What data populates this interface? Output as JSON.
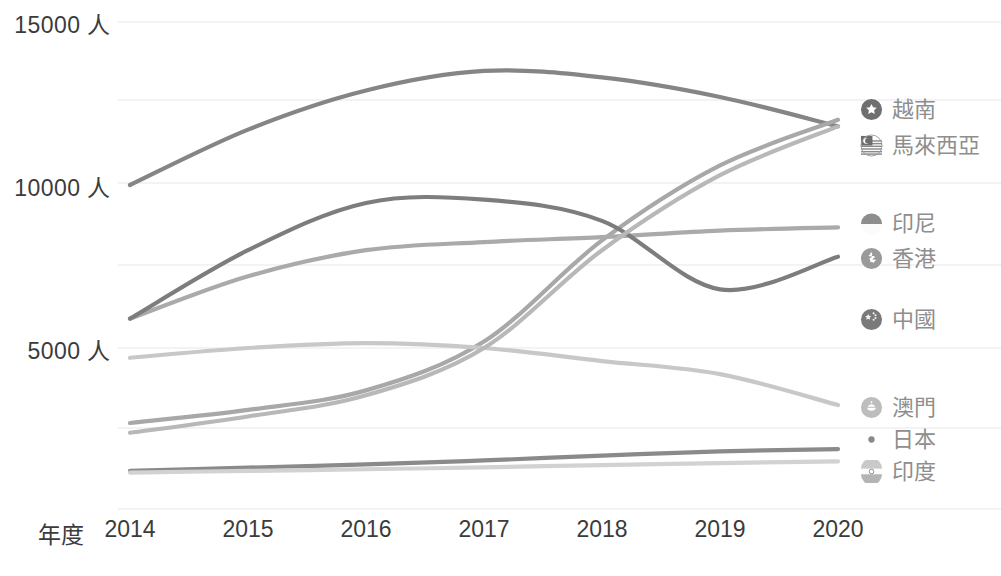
{
  "chart_data": {
    "type": "line",
    "title": "",
    "xlabel": "年度",
    "ylabel": "",
    "x": [
      2014,
      2015,
      2016,
      2017,
      2018,
      2019,
      2020
    ],
    "xtick_labels": [
      "2014",
      "2015",
      "2016",
      "2017",
      "2018",
      "2019",
      "2020"
    ],
    "ytick_labels": [
      "15000 人",
      "10000 人",
      "5000 人"
    ],
    "ytick_values": [
      15000,
      10000,
      5000
    ],
    "ylim": [
      0,
      15000
    ],
    "xlim": [
      2014,
      2020
    ],
    "grid": true,
    "grid_axis": "y",
    "legend_position": "right",
    "unit": "人",
    "series": [
      {
        "name": "越南",
        "flag": "vietnam-flag-icon",
        "color": "#858585",
        "values": [
          10000,
          11700,
          12900,
          13500,
          13300,
          12700,
          11800
        ]
      },
      {
        "name": "馬來西亞",
        "flag": "malaysia-flag-icon",
        "color": "#a8a8a8",
        "values": [
          2700,
          3100,
          3700,
          5200,
          8300,
          10600,
          12000
        ]
      },
      {
        "name": "印尼",
        "flag": "indonesia-flag-icon",
        "color": "#c8c8c8",
        "values": [
          4700,
          5000,
          5150,
          5000,
          4600,
          4200,
          3250
        ]
      },
      {
        "name": "香港",
        "flag": "hongkong-flag-icon",
        "color": "#aaaaaa",
        "values": [
          5900,
          7200,
          8000,
          8250,
          8400,
          8600,
          8700
        ]
      },
      {
        "name": "中國",
        "flag": "china-flag-icon",
        "color": "#7d7d7d",
        "values": [
          5900,
          8000,
          9450,
          9550,
          8900,
          6800,
          7800
        ]
      },
      {
        "name": "澳門",
        "flag": "macau-flag-icon",
        "color": "#b8b8b8",
        "values": [
          2400,
          2900,
          3550,
          5000,
          8000,
          10300,
          11800
        ]
      },
      {
        "name": "日本",
        "flag": "japan-flag-icon",
        "color": "#8a8a8a",
        "values": [
          1230,
          1330,
          1430,
          1550,
          1700,
          1830,
          1900
        ]
      },
      {
        "name": "印度",
        "flag": "india-flag-icon",
        "color": "#d2d2d2",
        "values": [
          1180,
          1230,
          1280,
          1340,
          1410,
          1470,
          1520
        ]
      }
    ]
  },
  "legend": {
    "items": [
      {
        "label": "越南",
        "flag": "vietnam-flag-icon",
        "top": 110
      },
      {
        "label": "馬來西亞",
        "flag": "malaysia-flag-icon",
        "top": 146
      },
      {
        "label": "印尼",
        "flag": "indonesia-flag-icon",
        "top": 224
      },
      {
        "label": "香港",
        "flag": "hongkong-flag-icon",
        "top": 259
      },
      {
        "label": "中國",
        "flag": "china-flag-icon",
        "top": 320
      },
      {
        "label": "澳門",
        "flag": "macau-flag-icon",
        "top": 408
      },
      {
        "label": "日本",
        "flag": "japan-flag-icon",
        "top": 440
      },
      {
        "label": "印度",
        "flag": "india-flag-icon",
        "top": 472
      }
    ]
  },
  "colors": {
    "background": "#ffffff",
    "axis_text": "#3b3b3b",
    "legend_text": "#8e8e8e",
    "gridline": "#f0eef0"
  }
}
